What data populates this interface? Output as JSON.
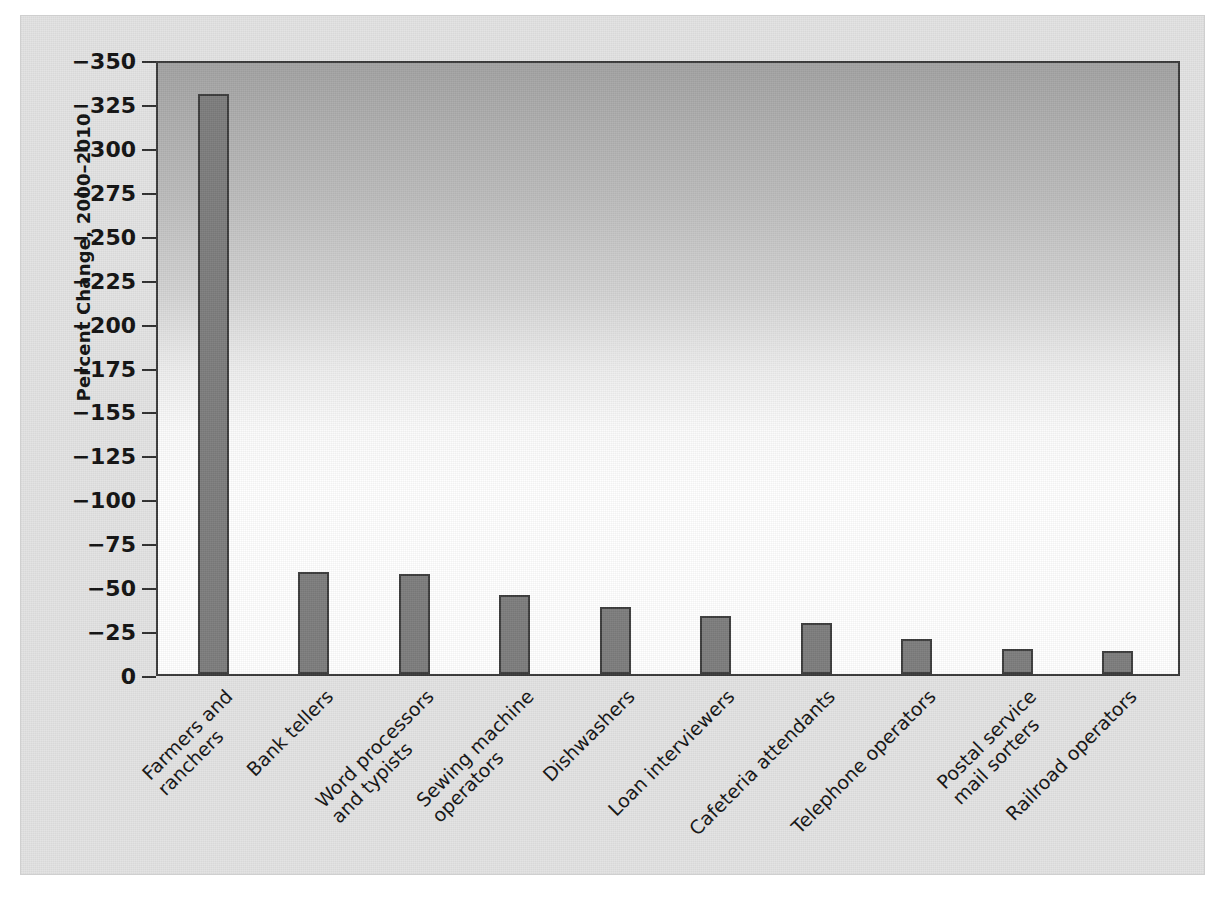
{
  "chart_data": {
    "type": "bar",
    "title": "",
    "subtitle": "",
    "xlabel": "",
    "ylabel": "Percent Change, 2000–2010",
    "orientation": "vertical",
    "grid": false,
    "legend": null,
    "axis_note": "Y axis is plotted as magnitude of decline; tick labels are negative and increase downward-to-upward. Tick label −155 appears in the source where −150 would be expected.",
    "ylim": [
      0,
      -350
    ],
    "ytick_labels": [
      "−350",
      "−325",
      "−300",
      "−275",
      "−250",
      "−225",
      "−200",
      "−175",
      "−155",
      "−125",
      "−100",
      "−75",
      "−50",
      "−25",
      "0"
    ],
    "ytick_values": [
      -350,
      -325,
      -300,
      -275,
      -250,
      -225,
      -200,
      -175,
      -150,
      -125,
      -100,
      -75,
      -50,
      -25,
      0
    ],
    "categories": [
      "Farmers and ranchers",
      "Bank tellers",
      "Word processors and typists",
      "Sewing machine operators",
      "Dishwashers",
      "Loan interviewers",
      "Cafeteria attendants",
      "Telephone operators",
      "Postal service mail sorters",
      "Railroad operators"
    ],
    "category_lines": [
      [
        "Farmers and",
        "ranchers"
      ],
      [
        "Bank tellers"
      ],
      [
        "Word processors",
        "and typists"
      ],
      [
        "Sewing machine",
        "operators"
      ],
      [
        "Dishwashers"
      ],
      [
        "Loan interviewers"
      ],
      [
        "Cafeteria attendants"
      ],
      [
        "Telephone operators"
      ],
      [
        "Postal service",
        "mail sorters"
      ],
      [
        "Railroad operators"
      ]
    ],
    "values": [
      -330,
      -58,
      -57,
      -45,
      -38,
      -33,
      -29,
      -20,
      -14,
      -13
    ],
    "magnitudes": [
      330,
      58,
      57,
      45,
      38,
      33,
      29,
      20,
      14,
      13
    ]
  },
  "style": {
    "bar_fill": "#7d7d7d",
    "bar_stroke": "#3c3c3c",
    "figure_background": "#e3e3e3",
    "plot_gradient_top": "#a2a2a2",
    "plot_gradient_bottom": "#ffffff",
    "axis_color": "#2e2e2e",
    "text_color": "#111111"
  }
}
